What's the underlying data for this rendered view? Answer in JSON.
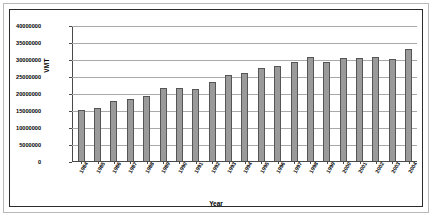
{
  "chart_data": {
    "type": "bar",
    "title": "",
    "xlabel": "Year",
    "ylabel": "VMT",
    "ylim": [
      0,
      40000000
    ],
    "ytick_step": 5000000,
    "grid": true,
    "legend": "none",
    "ytick_labels": [
      "40000000",
      "35000000",
      "30000000",
      "25000000",
      "20000000",
      "15000000",
      "10000000",
      "5000000",
      "0"
    ],
    "categories": [
      "1984",
      "1985",
      "1986",
      "1987",
      "1988",
      "1989",
      "1990",
      "1991",
      "1992",
      "1993",
      "1994",
      "1995",
      "1996",
      "1997",
      "1998",
      "1999",
      "2000",
      "2001",
      "2002",
      "2003",
      "2004"
    ],
    "values": [
      15000000,
      15700000,
      17700000,
      18200000,
      19000000,
      21500000,
      21400000,
      21300000,
      23200000,
      25300000,
      26000000,
      27300000,
      28000000,
      29200000,
      30500000,
      29200000,
      30200000,
      30400000,
      30500000,
      30100000,
      33000000
    ],
    "series": [
      {
        "name": "VMT",
        "color": "#9a9a9a",
        "values": [
          15000000,
          15700000,
          17700000,
          18200000,
          19000000,
          21500000,
          21400000,
          21300000,
          23200000,
          25300000,
          26000000,
          27300000,
          28000000,
          29200000,
          30500000,
          29200000,
          30200000,
          30400000,
          30500000,
          30100000,
          33000000
        ]
      }
    ]
  },
  "colors": {
    "bar_fill": "#9a9a9a",
    "bar_stroke": "#555555",
    "gridline": "#a9a9a9",
    "axis": "#4a4a4a",
    "outer_border": "#b8b8b8",
    "inner_border": "#2b2b2b",
    "background": "#ffffff"
  }
}
